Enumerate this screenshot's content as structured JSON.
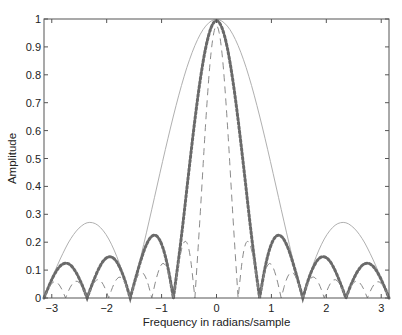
{
  "chart_data": {
    "type": "line",
    "title": "",
    "xlabel": "Frequency in radians/sample",
    "ylabel": "Amplitude",
    "xlim": [
      -3.1416,
      3.1416
    ],
    "ylim": [
      0,
      1
    ],
    "xticks": [
      -3,
      -2,
      -1,
      0,
      1,
      2,
      3
    ],
    "yticks": [
      0,
      0.1,
      0.2,
      0.3,
      0.4,
      0.5,
      0.6,
      0.7,
      0.8,
      0.9,
      1
    ],
    "ytick_labels": [
      "0",
      "0.1",
      "0.2",
      "0.3",
      "0.4",
      "0.5",
      "0.6",
      "0.7",
      "0.8",
      "0.9",
      "1"
    ],
    "grid": false,
    "legend": null,
    "x": [
      -3.142,
      -3.043,
      -2.945,
      -2.847,
      -2.749,
      -2.651,
      -2.553,
      -2.454,
      -2.356,
      -2.258,
      -2.16,
      -2.062,
      -1.963,
      -1.865,
      -1.767,
      -1.669,
      -1.571,
      -1.473,
      -1.374,
      -1.276,
      -1.178,
      -1.08,
      -0.982,
      -0.884,
      -0.785,
      -0.687,
      -0.589,
      -0.491,
      -0.393,
      -0.295,
      -0.196,
      -0.098,
      0.0,
      0.098,
      0.196,
      0.295,
      0.393,
      0.491,
      0.589,
      0.687,
      0.785,
      0.884,
      0.982,
      1.08,
      1.178,
      1.276,
      1.374,
      1.473,
      1.571,
      1.669,
      1.767,
      1.865,
      1.963,
      2.062,
      2.16,
      2.258,
      2.356,
      2.454,
      2.553,
      2.651,
      2.749,
      2.847,
      2.945,
      3.043,
      3.142
    ],
    "series": [
      {
        "name": "N=4 (thin solid)",
        "style": "solid",
        "color": "#b0b0b0",
        "width": 1,
        "values": [
          0,
          0.049,
          0.096,
          0.14,
          0.18,
          0.214,
          0.241,
          0.26,
          0.271,
          0.271,
          0.262,
          0.242,
          0.213,
          0.173,
          0.124,
          0.066,
          0,
          0.073,
          0.151,
          0.233,
          0.318,
          0.404,
          0.49,
          0.573,
          0.653,
          0.728,
          0.796,
          0.855,
          0.906,
          0.947,
          0.976,
          0.994,
          1,
          0.994,
          0.976,
          0.947,
          0.906,
          0.855,
          0.796,
          0.728,
          0.653,
          0.573,
          0.49,
          0.404,
          0.318,
          0.233,
          0.151,
          0.073,
          0,
          0.066,
          0.124,
          0.173,
          0.213,
          0.242,
          0.262,
          0.271,
          0.271,
          0.26,
          0.241,
          0.214,
          0.18,
          0.14,
          0.096,
          0.049,
          0
        ]
      },
      {
        "name": "N=8 (dotted markers)",
        "style": "markers",
        "color": "#6a6a6a",
        "width": 3,
        "values": [
          0,
          0.048,
          0.089,
          0.117,
          0.127,
          0.119,
          0.092,
          0.051,
          0,
          0.053,
          0.1,
          0.135,
          0.15,
          0.144,
          0.114,
          0.065,
          0,
          0.071,
          0.139,
          0.194,
          0.225,
          0.225,
          0.188,
          0.112,
          0,
          0.142,
          0.304,
          0.475,
          0.641,
          0.787,
          0.902,
          0.975,
          1,
          0.975,
          0.902,
          0.787,
          0.641,
          0.475,
          0.304,
          0.142,
          0,
          0.112,
          0.188,
          0.225,
          0.225,
          0.194,
          0.139,
          0.071,
          0,
          0.065,
          0.114,
          0.144,
          0.15,
          0.135,
          0.1,
          0.053,
          0,
          0.051,
          0.092,
          0.119,
          0.127,
          0.117,
          0.089,
          0.048,
          0
        ]
      },
      {
        "name": "N=16 (dashed)",
        "style": "dashed",
        "color": "#8a8a8a",
        "width": 1,
        "values": [
          0,
          0.044,
          0.063,
          0.045,
          0,
          0.046,
          0.065,
          0.047,
          0,
          0.049,
          0.071,
          0.052,
          0,
          0.055,
          0.081,
          0.06,
          0,
          0.066,
          0.099,
          0.074,
          0,
          0.086,
          0.133,
          0.103,
          0,
          0.131,
          0.215,
          0.182,
          0,
          0.301,
          0.638,
          0.901,
          1,
          0.901,
          0.638,
          0.301,
          0,
          0.182,
          0.215,
          0.131,
          0,
          0.103,
          0.133,
          0.086,
          0,
          0.074,
          0.099,
          0.066,
          0,
          0.06,
          0.081,
          0.055,
          0,
          0.052,
          0.071,
          0.049,
          0,
          0.047,
          0.065,
          0.046,
          0,
          0.045,
          0.063,
          0.044,
          0
        ]
      }
    ]
  },
  "layout": {
    "plot_left": 44,
    "plot_top": 19,
    "plot_right": 389,
    "plot_bottom": 298
  }
}
